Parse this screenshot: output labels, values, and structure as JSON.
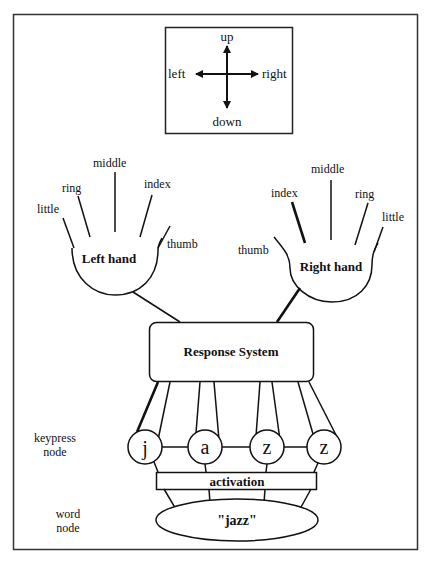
{
  "direction_box": {
    "up": "up",
    "down": "down",
    "left": "left",
    "right": "right"
  },
  "left_hand": {
    "title": "Left hand",
    "fingers": [
      "little",
      "ring",
      "middle",
      "index",
      "thumb"
    ]
  },
  "right_hand": {
    "title": "Right hand",
    "fingers": [
      "thumb",
      "index",
      "middle",
      "ring",
      "little"
    ]
  },
  "response_system": {
    "label": "Response System"
  },
  "keypress": {
    "label_line1": "keypress",
    "label_line2": "node",
    "nodes": [
      "j",
      "a",
      "z",
      "z"
    ]
  },
  "activation": {
    "label": "activation"
  },
  "word": {
    "label_line1": "word",
    "label_line2": "node",
    "value": "\"jazz\""
  },
  "colors": {
    "stroke": "#111111",
    "background": "#ffffff"
  }
}
